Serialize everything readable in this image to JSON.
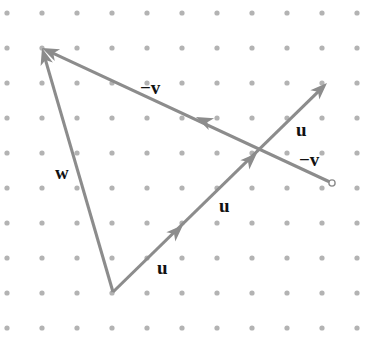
{
  "figure": {
    "width": 386,
    "height": 345,
    "background_color": "#ffffff",
    "stroke_color": "#8c8c8c",
    "dot_color": "#b3b3b3",
    "label_color": "#111111"
  },
  "grid": {
    "type": "dot-lattice",
    "origin_x": 7,
    "origin_y": 13,
    "spacing_x": 35,
    "spacing_y": 35,
    "columns": 11,
    "rows": 10,
    "dot_radius": 2.6
  },
  "points": {
    "apex_top_left": {
      "x": 42,
      "y": 48
    },
    "apex_bottom": {
      "x": 113,
      "y": 292
    },
    "tip_upper_right": {
      "x": 327,
      "y": 83
    },
    "tail_right_circle": {
      "x": 332,
      "y": 183
    },
    "crossing": {
      "x": 257,
      "y": 153
    }
  },
  "segments": [
    {
      "name": "w-vector",
      "from": {
        "x": 113,
        "y": 292
      },
      "to": {
        "x": 42,
        "y": 48
      },
      "arrow_at_end": true
    },
    {
      "name": "minus-v-vector",
      "from": {
        "x": 332,
        "y": 183
      },
      "to": {
        "x": 42,
        "y": 48
      },
      "arrow_at_end": true,
      "mid_arrow": {
        "x": 196,
        "y": 117
      },
      "open_circle_at_start": true
    },
    {
      "name": "u-vector-lower",
      "from": {
        "x": 113,
        "y": 292
      },
      "to": {
        "x": 327,
        "y": 83
      },
      "arrow_at_end": true,
      "mid_arrows": [
        {
          "x": 183,
          "y": 225
        },
        {
          "x": 257,
          "y": 153
        }
      ]
    }
  ],
  "labels": [
    {
      "name": "label-minus-v-top",
      "text": "−v",
      "x": 140,
      "y": 78
    },
    {
      "name": "label-w",
      "text": "w",
      "x": 55,
      "y": 163
    },
    {
      "name": "label-u-right",
      "text": "u",
      "x": 296,
      "y": 120
    },
    {
      "name": "label-minus-v-right",
      "text": "−v",
      "x": 299,
      "y": 150
    },
    {
      "name": "label-u-middle",
      "text": "u",
      "x": 219,
      "y": 196
    },
    {
      "name": "label-u-bottom",
      "text": "u",
      "x": 157,
      "y": 258
    }
  ]
}
